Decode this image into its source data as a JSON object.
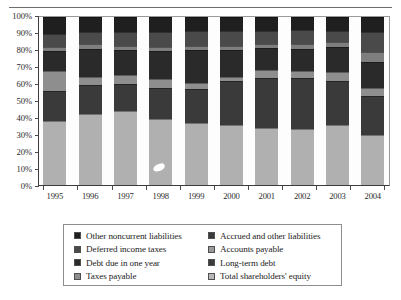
{
  "figure": {
    "has_top_rule": true
  },
  "chart_data": {
    "type": "bar",
    "stacked": true,
    "stack_mode": "percent",
    "title": "",
    "xlabel": "",
    "ylabel": "",
    "ylim": [
      0,
      100
    ],
    "ytick_labels": [
      "0%",
      "10%",
      "20%",
      "30%",
      "40%",
      "50%",
      "60%",
      "70%",
      "80%",
      "90%",
      "100%"
    ],
    "ytick_values": [
      0,
      10,
      20,
      30,
      40,
      50,
      60,
      70,
      80,
      90,
      100
    ],
    "grid": false,
    "legend_position": "bottom",
    "categories": [
      "1995",
      "1996",
      "1997",
      "1998",
      "1999",
      "2000",
      "2001",
      "2002",
      "2003",
      "2004"
    ],
    "series": [
      {
        "name": "Total shareholders' equity",
        "color": "#b0b0b0",
        "values": [
          38,
          42,
          44,
          39.5,
          37,
          36,
          34,
          33.5,
          36,
          30
        ]
      },
      {
        "name": "Long-term debt",
        "color": "#3a3a3a",
        "values": [
          18,
          17.5,
          16,
          18.5,
          20,
          26,
          30,
          30.5,
          26,
          23
        ]
      },
      {
        "name": "Taxes payable",
        "color": "#8e8e8e",
        "values": [
          12,
          5,
          5.5,
          5,
          4,
          2.5,
          4.5,
          4,
          5,
          5
        ]
      },
      {
        "name": "Accounts payable",
        "color": "#9a9a9a",
        "values": [
          0,
          0,
          0,
          0,
          0,
          0,
          0,
          0,
          0,
          0
        ]
      },
      {
        "name": "Debt due in one year",
        "color": "#2a2a2a",
        "values": [
          12,
          16.5,
          15,
          17,
          19.5,
          16,
          13,
          13,
          15,
          15
        ]
      },
      {
        "name": "Accrued and other liabilities",
        "color": "#7e7e7e",
        "values": [
          2,
          3,
          2.5,
          2,
          2,
          2,
          2.5,
          3,
          3,
          6
        ]
      },
      {
        "name": "Deferred income taxes",
        "color": "#4a4a4a",
        "values": [
          8,
          7,
          8,
          9,
          9,
          9,
          7.5,
          8,
          7,
          12
        ]
      },
      {
        "name": "Other noncurrent liabilities",
        "color": "#1f1f1f",
        "values": [
          10,
          9,
          9,
          9,
          8.5,
          8.5,
          8.5,
          8,
          8,
          9
        ]
      }
    ]
  },
  "legend": {
    "items": [
      {
        "label": "Other noncurrent liabilities",
        "color": "#1f1f1f"
      },
      {
        "label": "Accrued and other liabilities",
        "color": "#3a3a3a"
      },
      {
        "label": "Deferred income taxes",
        "color": "#4a4a4a"
      },
      {
        "label": "Accounts payable",
        "color": "#9a9a9a"
      },
      {
        "label": "Debt due in one year",
        "color": "#2a2a2a"
      },
      {
        "label": "Long-term debt",
        "color": "#3a3a3a"
      },
      {
        "label": "Taxes payable",
        "color": "#8e8e8e"
      },
      {
        "label": "Total shareholders' equity",
        "color": "#b8b8b8"
      }
    ]
  }
}
